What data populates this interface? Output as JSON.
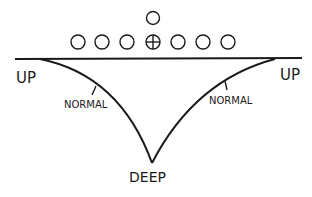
{
  "diagram": {
    "type": "formation-depth-diagram",
    "colors": {
      "ink": "#1a1a1a",
      "background": "#ffffff"
    },
    "formation": {
      "top_player": {
        "shape": "circle"
      },
      "line_players": [
        {
          "shape": "circle"
        },
        {
          "shape": "circle"
        },
        {
          "shape": "circle"
        },
        {
          "shape": "circle-cross",
          "note": "center"
        },
        {
          "shape": "circle"
        },
        {
          "shape": "circle"
        },
        {
          "shape": "circle"
        }
      ]
    },
    "labels": {
      "up_left": "UP",
      "up_right": "UP",
      "normal_left": "NORMAL",
      "normal_right": "NORMAL",
      "deep": "DEEP"
    }
  }
}
